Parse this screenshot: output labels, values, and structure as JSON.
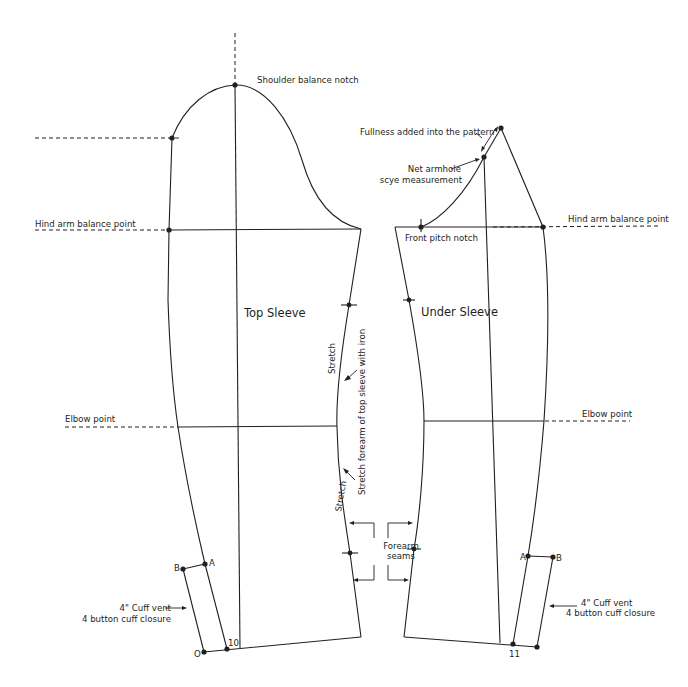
{
  "diagram": {
    "colors": {
      "line": "#231f20",
      "background": "#ffffff"
    },
    "top_sleeve": {
      "panel_label": "Top Sleeve",
      "labels": {
        "shoulder_notch": "Shoulder balance notch",
        "hind_arm": "Hind arm balance point",
        "elbow": "Elbow point",
        "stretch_upper": "Stretch",
        "stretch_lower": "Stretch",
        "stretch_note": "Stretch forearm of top sleeve with iron",
        "cuff_vent_line1": "4\" Cuff vent",
        "cuff_vent_line2": "4 button cuff closure",
        "point_a": "A",
        "point_b": "B",
        "point_o": "O",
        "point_10": "10"
      }
    },
    "under_sleeve": {
      "panel_label": "Under Sleeve",
      "labels": {
        "fullness": "Fullness added into the pattern",
        "net_armhole_line1": "Net armhole",
        "net_armhole_line2": "scye measurement",
        "front_pitch": "Front pitch notch",
        "hind_arm": "Hind arm balance point",
        "elbow": "Elbow point",
        "cuff_vent_line1": "4\" Cuff vent",
        "cuff_vent_line2": "4 button cuff closure",
        "point_a": "A",
        "point_b": "B",
        "point_11": "11"
      }
    },
    "forearm_seams": {
      "line1": "Forearm",
      "line2": "seams"
    }
  }
}
